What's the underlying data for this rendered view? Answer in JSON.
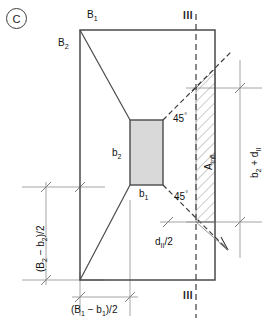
{
  "figure": {
    "panel_tag": "C",
    "colors": {
      "outline": "#4a4a4a",
      "column_fill": "#d9d9d9",
      "column_stroke": "#4a4a4a",
      "dimension_line": "#9a9a9a",
      "dashed_line": "#3d3d3d",
      "hatch": "#8c8c8c",
      "text": "#111111"
    },
    "labels": {
      "b_top": "B",
      "b_top_sub": "1",
      "b_left": "B",
      "b_left_sub": "2",
      "col_height": "b",
      "col_height_sub": "2",
      "col_width": "b",
      "col_width_sub": "1",
      "angle_upper": "45",
      "angle_upper_unit": "°",
      "angle_lower": "45",
      "angle_lower_unit": "°",
      "area_influence": "A",
      "area_influence_sub": "infl.",
      "right_dim": "b",
      "right_dim_sub": "2",
      "right_dim_tail": " + d",
      "right_dim_tail_sub": "II",
      "bottom_dim_open": "(B",
      "bottom_dim_sub1": "1",
      "bottom_dim_minus": " − b",
      "bottom_dim_sub2": "1",
      "bottom_dim_close": ")/2",
      "left_dim_open": "(B",
      "left_dim_sub1": "2",
      "left_dim_minus": " − b",
      "left_dim_sub2": "2",
      "left_dim_close": ")/2",
      "d_half": "d",
      "d_half_sub": "II",
      "d_half_tail": "/2",
      "section_mark_top": "III",
      "section_mark_bottom": "III"
    }
  },
  "geometry": {
    "footing": {
      "left": 80,
      "top": 30,
      "right": 215,
      "bottom": 280
    },
    "column": {
      "left": 130,
      "top": 120,
      "right": 163,
      "bottom": 185
    },
    "section_line_x": 196,
    "note": "45 degree punching cone spreads from column corners to section line III-III"
  }
}
